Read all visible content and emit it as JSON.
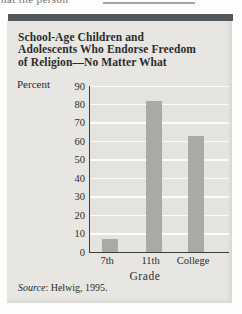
{
  "page": {
    "top_cropped_text": "hat the person"
  },
  "figure": {
    "title_lines": [
      "School-Age Children and",
      "Adolescents Who Endorse Freedom",
      "of Religion—No Matter What"
    ],
    "percent_label": "Percent",
    "grade_label": "Grade",
    "source_word": "Source",
    "source_rest": ": Helwig, 1995."
  },
  "chart_data": {
    "type": "bar",
    "categories": [
      "7th",
      "11th",
      "College"
    ],
    "values": [
      7,
      82,
      63
    ],
    "title": "School-Age Children and Adolescents Who Endorse Freedom of Religion—No Matter What",
    "xlabel": "Grade",
    "ylabel": "Percent",
    "ylim": [
      0,
      90
    ],
    "ytick_step": 10,
    "grid": true,
    "legend": "none",
    "source": "Source: Helwig, 1995."
  },
  "colors": {
    "header_bar": "#545758",
    "panel_bg": "#e7e6e2",
    "plot_bg": "#e4e3df",
    "bar_fill": "#a9a9a5",
    "grid_line": "#fbfbf9",
    "axis_line": "#3c3c3a",
    "text": "#2d2d2b"
  }
}
